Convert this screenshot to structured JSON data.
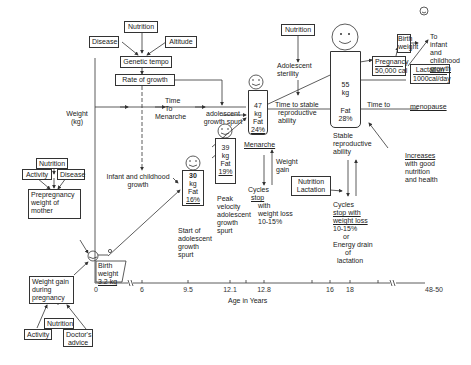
{
  "figure": {
    "y_axis_label": [
      "Weight",
      "(kg)"
    ],
    "x_axis_label": "Age in Years",
    "x_ticks": [
      "0",
      "6",
      "9.5",
      "12.1",
      "12.8",
      "16",
      "18",
      "48-50"
    ]
  },
  "top_factors": {
    "nutrition": "Nutrition",
    "disease": "Disease",
    "altitude": "Altitude",
    "genetic_tempo": "Genetic tempo",
    "rate_of_growth": "Rate of growth"
  },
  "time_to_menarche": [
    "Time",
    "To",
    "Menarche"
  ],
  "adolescent_growth_spurt": [
    "adolescent",
    "growth spurt"
  ],
  "infant_childhood_growth": [
    "Infant and childhood",
    "growth"
  ],
  "mother": {
    "nutrition": "Nutrition",
    "activity": "Activity",
    "disease": "Disease",
    "prepregnancy": [
      "Prepregnancy",
      "weight  of",
      "mother"
    ],
    "weight_gain": [
      "Weight gain",
      "during",
      "pregnancy"
    ],
    "wg_nutrition": "Nutrition",
    "wg_activity": "Activity",
    "wg_doctor": [
      "Doctor's",
      "advice"
    ]
  },
  "birth": [
    "Birth",
    "weight",
    "3.2 kg"
  ],
  "stage_30": {
    "weight": [
      "30",
      "kg"
    ],
    "fat": [
      "Fat",
      "16%"
    ],
    "caption": [
      "Start of",
      "adolescent",
      "growth",
      "spurt"
    ]
  },
  "stage_39": {
    "weight": [
      "39",
      "kg"
    ],
    "fat": [
      "Fat",
      "19%"
    ],
    "caption": [
      "Peak",
      "velocity",
      "adolescent",
      "growth",
      "spurt"
    ]
  },
  "stage_47": {
    "weight": [
      "47",
      "kg"
    ],
    "fat": [
      "Fat",
      "24%"
    ],
    "caption": "Menarche"
  },
  "weight_gain_label": [
    "Weight",
    "gain"
  ],
  "cycles_stop_1": {
    "l1": "Cycles",
    "l2": "stop",
    "l3": "with",
    "l4": "weight loss",
    "l5": "10-15%"
  },
  "adolescent_nutrition": "Nutrition",
  "adolescent_sterility": [
    "Adolescent",
    "sterility"
  ],
  "time_to_stable": [
    "Time to stable",
    "reproductive",
    "ability"
  ],
  "stage_55": {
    "weight": [
      "55",
      "kg"
    ],
    "fat": [
      "Fat",
      "28%"
    ],
    "caption": [
      "Stable",
      "reproductive",
      "ability"
    ]
  },
  "nutrition_lactation": [
    "Nutrition",
    "Lactation"
  ],
  "cycles_stop_2": {
    "l1": "Cycles",
    "l2": "stop with",
    "l3": "weight loss",
    "l4": "10-15%",
    "l5": "or",
    "l6": "Energy drain",
    "l7": "of",
    "l8": "lactation"
  },
  "pregnancy": [
    "Pregnancy",
    "50,000 cal"
  ],
  "lactation": [
    "Lactation",
    "1000cal/day"
  ],
  "birth_weight_2": [
    "Birth",
    "weight"
  ],
  "to_infant": [
    "To",
    "infant",
    "and",
    "childhood",
    "growth"
  ],
  "time_to_menopause": {
    "a": "Time  to",
    "b": "menopause"
  },
  "increases": {
    "l1": "Increases",
    "l2": "with good",
    "l3": "nutrition",
    "l4": "and health"
  }
}
